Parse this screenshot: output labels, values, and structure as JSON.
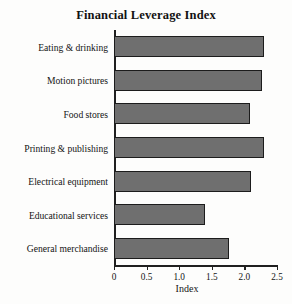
{
  "chart_data": {
    "type": "bar",
    "orientation": "horizontal",
    "title": "Financial Leverage Index",
    "xlabel": "Index",
    "ylabel": "",
    "categories": [
      "Eating & drinking",
      "Motion pictures",
      "Food stores",
      "Printing & publishing",
      "Electrical equipment",
      "Educational services",
      "General merchandise"
    ],
    "values": [
      2.3,
      2.27,
      2.09,
      2.3,
      2.1,
      1.4,
      1.76
    ],
    "xlim": [
      0,
      2.5
    ],
    "xticks": [
      0,
      0.5,
      1.0,
      1.5,
      2.0,
      2.5
    ],
    "xticklabels": [
      "0",
      "0.5",
      "1.0",
      "1.5",
      "2.0",
      "2.5"
    ],
    "grid": false,
    "legend": false,
    "bar_color": "#6f6f6f",
    "bar_edge_color": "#1c1c1c",
    "axis_color": "#202020",
    "background_color": "#fdfdfc"
  }
}
